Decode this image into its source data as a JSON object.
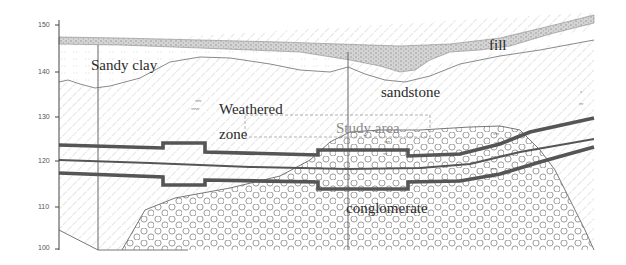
{
  "diagram": {
    "type": "geological cross-section",
    "y_axis": {
      "ticks": [
        {
          "value": "150",
          "y": 25
        },
        {
          "value": "140",
          "y": 72
        },
        {
          "value": "130",
          "y": 117
        },
        {
          "value": "120",
          "y": 161
        },
        {
          "value": "110",
          "y": 207
        },
        {
          "value": "100",
          "y": 247
        }
      ]
    },
    "layers": {
      "fill": "fill",
      "sandy_clay": "Sandy clay",
      "sandstone": "sandstone",
      "weathered_line1": "Weathered",
      "weathered_line2": "zone",
      "study_area": "Study area",
      "conglomerate": "conglomerate"
    },
    "weathering_symbols": {
      "s1": "ʸʸʸʸ",
      "s2": "ʸʸʸʸ",
      "s3": "ʸʸʸ",
      "s4": "ʸʸʸʸ",
      "s5": "ʸʸ",
      "s6": "ʸʸʸʸ",
      "s7": "ʸ ʸ"
    },
    "colors": {
      "line": "#555555",
      "hatch": "#b8b8b8",
      "fill_band": "#c8c8c8",
      "circle": "#9a9a9a",
      "axis": "#444444"
    }
  }
}
